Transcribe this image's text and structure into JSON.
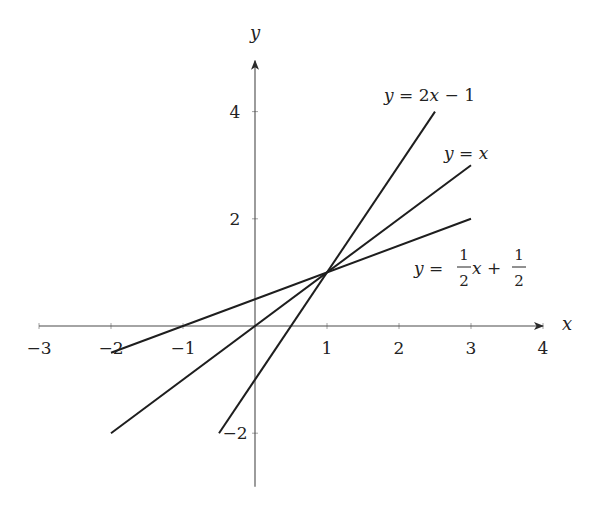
{
  "chart_data": {
    "type": "line",
    "title": "",
    "xlabel": "x",
    "ylabel": "y",
    "xlim": [
      -3,
      4
    ],
    "ylim": [
      -3,
      4.5
    ],
    "grid": false,
    "legend": "inline labels",
    "x_ticks": [
      -3,
      -2,
      -1,
      1,
      2,
      3,
      4
    ],
    "x_tick_labels": [
      "−3",
      "−2",
      "−1",
      "1",
      "2",
      "3",
      "4"
    ],
    "y_ticks": [
      -2,
      2,
      4
    ],
    "y_tick_labels": [
      "−2",
      "2",
      "4"
    ],
    "series": [
      {
        "name": "y = 2x − 1",
        "expression": "2x-1",
        "x": [
          -0.5,
          2.5
        ],
        "y": [
          -2,
          4
        ]
      },
      {
        "name": "y = x",
        "expression": "x",
        "x": [
          -2,
          3
        ],
        "y": [
          -2,
          3
        ]
      },
      {
        "name": "y = 1/2 x + 1/2",
        "expression": "0.5x+0.5",
        "x": [
          -2,
          3
        ],
        "y": [
          -0.5,
          2
        ]
      }
    ],
    "annotations": [
      {
        "text": "y = 2x − 1",
        "near": [
          2.5,
          4.3
        ]
      },
      {
        "text": "y = x",
        "near": [
          3,
          3.2
        ]
      },
      {
        "text": "y = ½x + ½",
        "near": [
          3.4,
          1.1
        ]
      }
    ],
    "intersection": {
      "x": 1,
      "y": 1
    }
  },
  "labels": {
    "x_axis": "x",
    "y_axis": "y",
    "eq1": {
      "lhs": "y",
      "eq": " = 2",
      "var": "x",
      "rest": " − 1"
    },
    "eq2": {
      "lhs": "y",
      "eq": " = ",
      "var": "x"
    },
    "eq3": {
      "lhs": "y",
      "eq": " = ",
      "num": "1",
      "den": "2",
      "var": "x",
      "plus": " + ",
      "num2": "1",
      "den2": "2"
    }
  },
  "style": {
    "line_color": "#1e1e1e",
    "axis_color": "#4a4a4a",
    "background": "#ffffff"
  }
}
